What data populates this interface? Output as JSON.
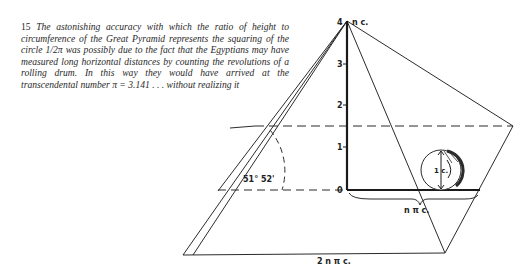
{
  "caption": {
    "number": "15",
    "text": "The astonishing accuracy with which the ratio of height to circumference of the Great Pyramid represents the squaring of the circle 1/2π was possibly due to the fact that the Egyptians may have measured long horizontal distances by counting the revolutions of a rolling drum. In this way they would have arrived at the transcendental number π = 3.141 . . . without realizing it"
  },
  "figure": {
    "apex_label_left": "4",
    "apex_label_right": "n c.",
    "axis_ticks": [
      "3",
      "2",
      "1",
      "0"
    ],
    "angle_label": "51° 52'",
    "drum_label": "1 c.",
    "ground_label": "n π c.",
    "base_label": "2 n π c."
  }
}
